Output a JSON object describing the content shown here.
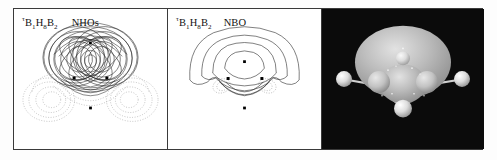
{
  "figure": {
    "panels": [
      {
        "id": "nho",
        "label_tau": "τ",
        "label_formula_b1": "B",
        "label_sub1": "1",
        "label_h": "H",
        "label_sub8": "8",
        "label_b2": "B",
        "label_sub2": "2",
        "orbital_name": "NHOs",
        "description": "overlapping natural hybrid orbital contour pair",
        "contour_style": "solid-positive-dotted-negative",
        "nuclei_count": 4
      },
      {
        "id": "nbo",
        "label_tau": "τ",
        "label_formula_b1": "B",
        "label_sub1": "1",
        "label_h": "H",
        "label_sub8": "8",
        "label_b2": "B",
        "label_sub2": "2",
        "orbital_name": "NBO",
        "description": "three-center natural bond orbital contour",
        "contour_style": "solid-positive-dotted-negative",
        "nuclei_count": 4
      },
      {
        "id": "iso",
        "orbital_name": "",
        "description": "three-dimensional orbital isosurface rendering",
        "background_color": "#0b0b0b",
        "surface_color": "#b9b9b9",
        "atom_color": "#f2f2f2",
        "atoms": [
          "B1",
          "B2",
          "H8",
          "H-terminal-left",
          "H-terminal-right"
        ]
      }
    ],
    "colors": {
      "frame": "#3a3a3a",
      "paper": "#ffffff",
      "contour_positive": "#2b2b2b",
      "contour_negative": "#7a7a7a",
      "nucleus": "#000000",
      "iso_background": "#0b0b0b"
    }
  }
}
